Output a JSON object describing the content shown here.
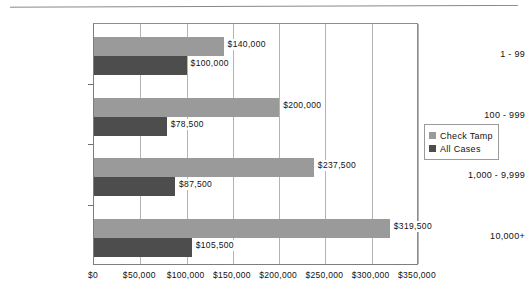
{
  "chart_data": {
    "type": "bar",
    "orientation": "horizontal",
    "title": "",
    "subtitle": "",
    "xlabel": "",
    "ylabel": "",
    "categories": [
      "1 - 99",
      "100 - 999",
      "1,000 - 9,999",
      "10,000+"
    ],
    "series": [
      {
        "name": "Check Tamp",
        "color": "#9a9a9a",
        "values": [
          140000,
          200000,
          237500,
          319500
        ],
        "data_labels": [
          "$140,000",
          "$200,000",
          "$237,500",
          "$319,500"
        ]
      },
      {
        "name": "All Cases",
        "color": "#4d4d4d",
        "values": [
          100000,
          78500,
          87500,
          105500
        ],
        "data_labels": [
          "$100,000",
          "$78,500",
          "$87,500",
          "$105,500"
        ]
      }
    ],
    "xlim": [
      0,
      350000
    ],
    "xticks": [
      0,
      50000,
      100000,
      150000,
      200000,
      250000,
      300000,
      350000
    ],
    "xtick_labels": [
      "$0",
      "$50,000",
      "$100,000",
      "$150,000",
      "$200,000",
      "$250,000",
      "$300,000",
      "$350,000"
    ],
    "grid": "vertical",
    "legend_position": "right",
    "legend": [
      {
        "label": "Check Tamp",
        "swatch": "light-gray-swatch-icon"
      },
      {
        "label": "All Cases",
        "swatch": "dark-gray-swatch-icon"
      }
    ]
  },
  "colors": {
    "series_light": "#9a9a9a",
    "series_dark": "#4d4d4d",
    "gridline": "#b4b4b4",
    "axis": "#7d7d7d",
    "text": "#111111",
    "background": "#ffffff"
  }
}
